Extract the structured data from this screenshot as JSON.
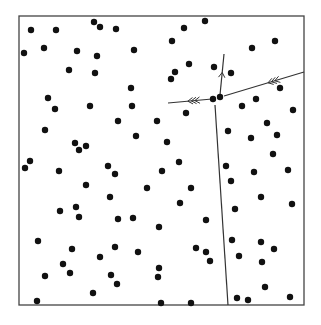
{
  "figure": {
    "width": 321,
    "height": 325,
    "background": "#ffffff",
    "ink": "#111111",
    "frame": {
      "x1": 19,
      "y1": 16,
      "x2": 304,
      "y2": 305,
      "color": "#444444",
      "stroke": 1.3
    },
    "dot_radius": 3.2
  },
  "points": [
    [
      31,
      30
    ],
    [
      56,
      30
    ],
    [
      94,
      22
    ],
    [
      100,
      27
    ],
    [
      116,
      29
    ],
    [
      24,
      53
    ],
    [
      44,
      48
    ],
    [
      77,
      51
    ],
    [
      97,
      56
    ],
    [
      69,
      70
    ],
    [
      95,
      73
    ],
    [
      205,
      21
    ],
    [
      184,
      28
    ],
    [
      172,
      41
    ],
    [
      134,
      50
    ],
    [
      189,
      64
    ],
    [
      214,
      67
    ],
    [
      175,
      72
    ],
    [
      171,
      79
    ],
    [
      131,
      88
    ],
    [
      275,
      41
    ],
    [
      252,
      48
    ],
    [
      231,
      73
    ],
    [
      280,
      88
    ],
    [
      48,
      98
    ],
    [
      55,
      109
    ],
    [
      90,
      106
    ],
    [
      118,
      121
    ],
    [
      45,
      130
    ],
    [
      75,
      143
    ],
    [
      86,
      146
    ],
    [
      79,
      150
    ],
    [
      30,
      161
    ],
    [
      25,
      168
    ],
    [
      108,
      166
    ],
    [
      132,
      106
    ],
    [
      186,
      113
    ],
    [
      157,
      121
    ],
    [
      136,
      136
    ],
    [
      167,
      142
    ],
    [
      179,
      162
    ],
    [
      162,
      171
    ],
    [
      256,
      99
    ],
    [
      242,
      106
    ],
    [
      293,
      110
    ],
    [
      267,
      123
    ],
    [
      228,
      131
    ],
    [
      277,
      135
    ],
    [
      251,
      138
    ],
    [
      273,
      154
    ],
    [
      226,
      166
    ],
    [
      288,
      170
    ],
    [
      59,
      171
    ],
    [
      115,
      174
    ],
    [
      86,
      185
    ],
    [
      110,
      197
    ],
    [
      76,
      207
    ],
    [
      60,
      211
    ],
    [
      79,
      217
    ],
    [
      118,
      219
    ],
    [
      147,
      188
    ],
    [
      191,
      188
    ],
    [
      180,
      203
    ],
    [
      133,
      218
    ],
    [
      206,
      220
    ],
    [
      159,
      227
    ],
    [
      254,
      172
    ],
    [
      231,
      181
    ],
    [
      261,
      197
    ],
    [
      235,
      209
    ],
    [
      292,
      204
    ],
    [
      38,
      241
    ],
    [
      72,
      249
    ],
    [
      115,
      247
    ],
    [
      100,
      257
    ],
    [
      63,
      264
    ],
    [
      70,
      273
    ],
    [
      45,
      276
    ],
    [
      111,
      275
    ],
    [
      117,
      284
    ],
    [
      93,
      293
    ],
    [
      37,
      301
    ],
    [
      138,
      252
    ],
    [
      196,
      248
    ],
    [
      206,
      252
    ],
    [
      210,
      261
    ],
    [
      159,
      268
    ],
    [
      158,
      277
    ],
    [
      161,
      303
    ],
    [
      191,
      303
    ],
    [
      232,
      240
    ],
    [
      261,
      242
    ],
    [
      274,
      249
    ],
    [
      239,
      256
    ],
    [
      262,
      262
    ],
    [
      265,
      287
    ],
    [
      237,
      298
    ],
    [
      248,
      300
    ],
    [
      290,
      297
    ],
    [
      213,
      99
    ],
    [
      220,
      97
    ]
  ],
  "edges": [
    {
      "name": "edge-right",
      "x1": 304,
      "y1": 72,
      "x2": 224,
      "y2": 96,
      "arrows": {
        "count": 3,
        "at": 0.45,
        "direction": "toward-end"
      }
    },
    {
      "name": "edge-left",
      "x1": 212,
      "y1": 99,
      "x2": 168,
      "y2": 103,
      "arrows": {
        "count": 3,
        "at": 0.55,
        "direction": "toward-end"
      }
    },
    {
      "name": "edge-up",
      "x1": 220,
      "y1": 95,
      "x2": 224,
      "y2": 54,
      "arrows": {
        "count": 1,
        "at": 0.55,
        "direction": "toward-end"
      }
    },
    {
      "name": "edge-down",
      "x1": 215,
      "y1": 105,
      "x2": 228,
      "y2": 305,
      "arrows": {
        "count": 0
      }
    }
  ]
}
